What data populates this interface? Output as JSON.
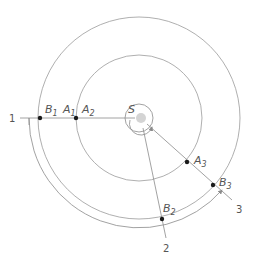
{
  "diagram": {
    "type": "orbital-positions",
    "colors": {
      "line": "#8a8a8a",
      "point": "#1a1a1a",
      "sun": "#d4d4d4",
      "text": "#555555"
    },
    "sun": {
      "label": "S"
    },
    "lines": [
      {
        "label": "1"
      },
      {
        "label": "2"
      },
      {
        "label": "3"
      }
    ],
    "inner_orbit": {
      "points": [
        {
          "label": "A",
          "sub": "1"
        },
        {
          "label": "A",
          "sub": "2"
        },
        {
          "label": "A",
          "sub": "3"
        }
      ]
    },
    "outer_orbit": {
      "points": [
        {
          "label": "B",
          "sub": "1"
        },
        {
          "label": "B",
          "sub": "2"
        },
        {
          "label": "B",
          "sub": "3"
        }
      ]
    }
  }
}
